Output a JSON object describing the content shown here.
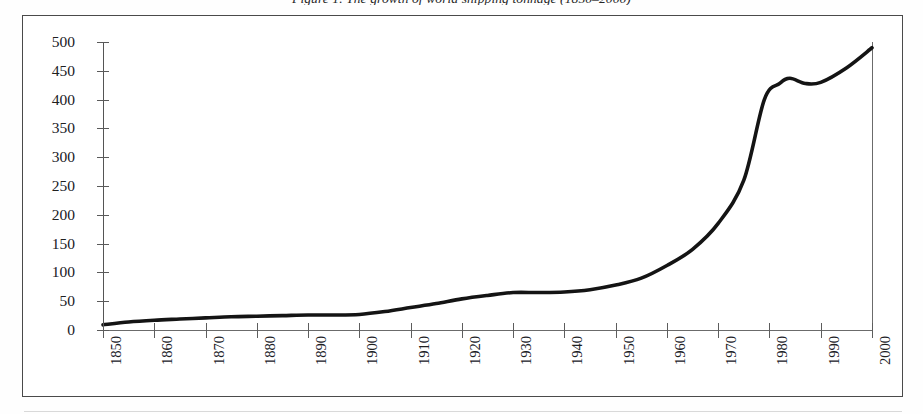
{
  "caption": {
    "text": "Figure 1. The growth of world shipping tonnage (1850–2000)"
  },
  "colors": {
    "line": "#141414",
    "frame": "#4a4a4a",
    "axis": "#5d5d5d",
    "text": "#20201f",
    "background": "#ffffff"
  },
  "axes": {
    "y_ticks": [
      "500",
      "450",
      "400",
      "350",
      "300",
      "250",
      "200",
      "150",
      "100",
      "50",
      "0"
    ],
    "x_ticks": [
      "1850",
      "1860",
      "1870",
      "1880",
      "1890",
      "1900",
      "1910",
      "1920",
      "1930",
      "1940",
      "1950",
      "1960",
      "1970",
      "1980",
      "1990",
      "2000"
    ]
  },
  "chart_data": {
    "type": "line",
    "title": "Figure 1. The growth of world shipping tonnage (1850–2000)",
    "xlabel": "",
    "ylabel": "",
    "xlim": [
      1850,
      2000
    ],
    "ylim": [
      0,
      500
    ],
    "grid": false,
    "legend": "none",
    "x_tick_values": [
      1850,
      1860,
      1870,
      1880,
      1890,
      1900,
      1910,
      1920,
      1930,
      1940,
      1950,
      1960,
      1970,
      1980,
      1990,
      2000
    ],
    "y_tick_values": [
      0,
      50,
      100,
      150,
      200,
      250,
      300,
      350,
      400,
      450,
      500
    ],
    "series": [
      {
        "name": "World shipping tonnage",
        "x": [
          1850,
          1855,
          1860,
          1865,
          1870,
          1875,
          1880,
          1885,
          1890,
          1895,
          1900,
          1905,
          1910,
          1915,
          1920,
          1925,
          1930,
          1935,
          1940,
          1945,
          1950,
          1955,
          1960,
          1965,
          1970,
          1975,
          1979,
          1982,
          1984,
          1987,
          1990,
          1995,
          2000
        ],
        "values": [
          9,
          14,
          17,
          19,
          21,
          23,
          24,
          25,
          26,
          26,
          27,
          32,
          39,
          46,
          54,
          60,
          65,
          65,
          66,
          70,
          78,
          90,
          112,
          140,
          185,
          260,
          400,
          428,
          437,
          428,
          430,
          455,
          490
        ]
      }
    ]
  }
}
